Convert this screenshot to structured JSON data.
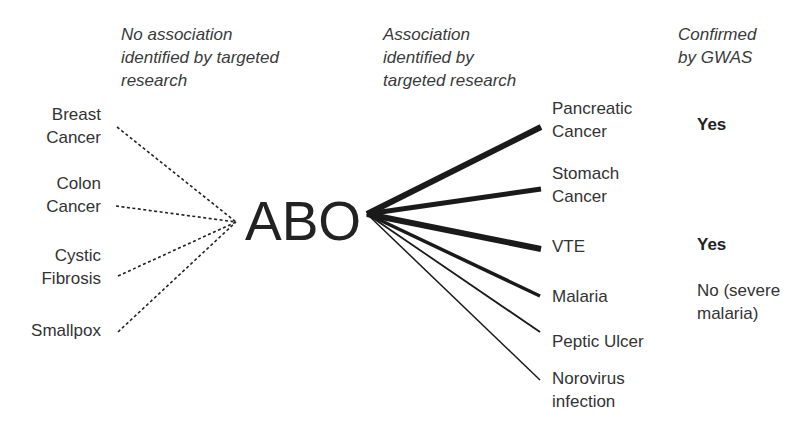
{
  "headers": {
    "no_association": [
      "No association",
      "identified by targeted",
      "research"
    ],
    "association": [
      "Association",
      "identified by",
      "targeted research"
    ],
    "gwas": [
      "Confirmed",
      "by GWAS"
    ]
  },
  "center": {
    "label": "ABO"
  },
  "no_association_items": [
    {
      "lines": [
        "Breast",
        "Cancer"
      ]
    },
    {
      "lines": [
        "Colon",
        "Cancer"
      ]
    },
    {
      "lines": [
        "Cystic",
        "Fibrosis"
      ]
    },
    {
      "lines": [
        "Smallpox"
      ]
    }
  ],
  "association_items": [
    {
      "lines": [
        "Pancreatic",
        "Cancer"
      ],
      "gwas": "Yes",
      "gwas_bold": true,
      "strength": "thick"
    },
    {
      "lines": [
        "Stomach",
        "Cancer"
      ],
      "gwas": "",
      "gwas_bold": false,
      "strength": "thick"
    },
    {
      "lines": [
        "VTE"
      ],
      "gwas": "Yes",
      "gwas_bold": true,
      "strength": "thick"
    },
    {
      "lines": [
        "Malaria"
      ],
      "gwas": "No (severe malaria)",
      "gwas_lines": [
        "No (severe",
        "malaria)"
      ],
      "gwas_bold": false,
      "strength": "medium"
    },
    {
      "lines": [
        "Peptic Ulcer"
      ],
      "gwas": "",
      "gwas_bold": false,
      "strength": "thin"
    },
    {
      "lines": [
        "Norovirus",
        "infection"
      ],
      "gwas": "",
      "gwas_bold": false,
      "strength": "thin"
    }
  ],
  "colors": {
    "text": "#333333",
    "line": "#1a1a1a",
    "background": "#ffffff"
  }
}
